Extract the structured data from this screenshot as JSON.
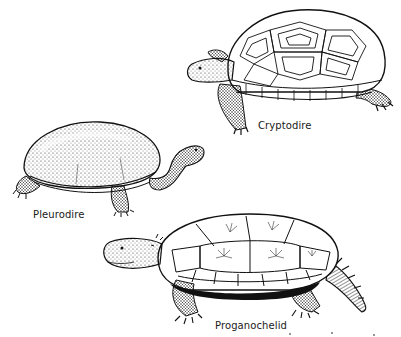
{
  "figure": {
    "ink_color": "#111111",
    "paper_color": "#ffffff",
    "turtles": [
      {
        "id": "cryptodire",
        "label": "Cryptodire"
      },
      {
        "id": "pleurodire",
        "label": "Pleurodire"
      },
      {
        "id": "proganochelid",
        "label": "Proganochelid"
      }
    ]
  }
}
